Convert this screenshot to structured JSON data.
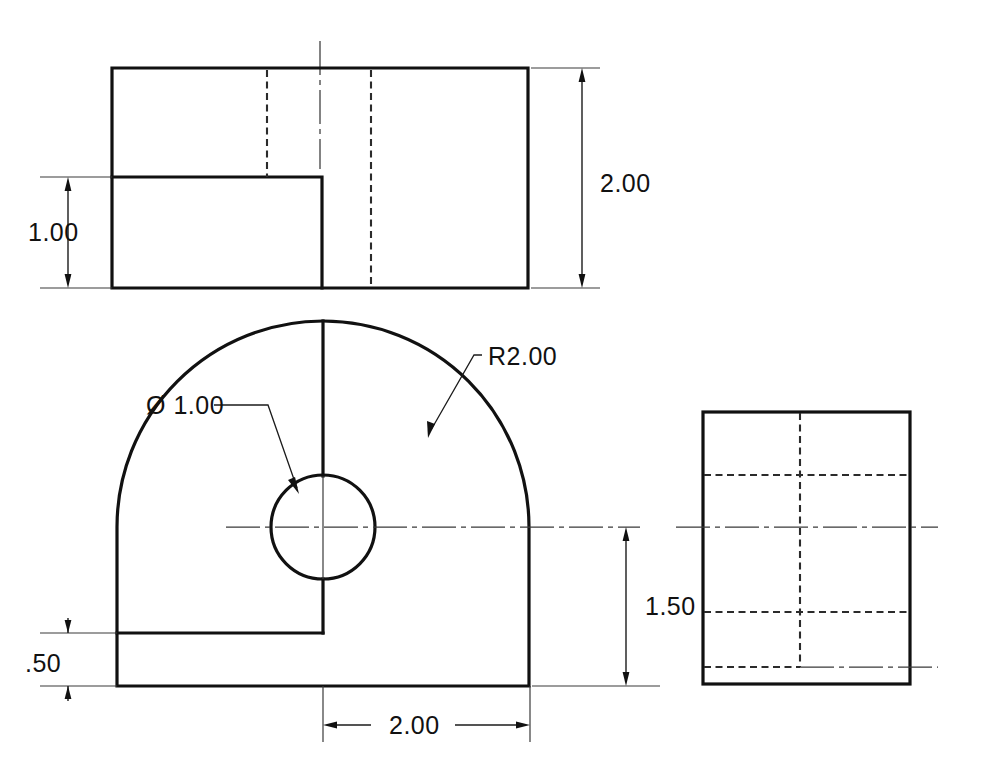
{
  "sheet": {
    "title": "Multiview Orthographic Engineering Drawing",
    "background_color": "#ffffff",
    "line_color": "#111111",
    "width": 990,
    "height": 778
  },
  "views": {
    "top": {
      "name": "Top View",
      "outline": {
        "x": 112,
        "y": 68,
        "width": 416,
        "height": 220
      },
      "step": {
        "edge_x": 322,
        "edge_y": 177
      },
      "hidden_lines_x": [
        267,
        371
      ],
      "centerline_x": 320
    },
    "front": {
      "name": "Front View",
      "base": {
        "left_x": 117,
        "right_x": 530,
        "bottom_y": 686
      },
      "step_y": 633,
      "arc_radius_px": 207,
      "arc_center": {
        "x": 323,
        "y": 527
      },
      "hole": {
        "cx": 323,
        "cy": 527,
        "r": 52
      }
    },
    "right": {
      "name": "Right Side View",
      "outline": {
        "x": 703,
        "y": 412,
        "width": 207,
        "height": 272
      },
      "hidden_vertical_x": 800,
      "hidden_horizontal_y": [
        475,
        612
      ],
      "centerline_y": 527,
      "lower_centerline_y": 667
    }
  },
  "dimensions": [
    {
      "id": "top-height",
      "label": "2.00",
      "value": 2.0,
      "kind": "linear-vertical",
      "view": "top",
      "text_x": 600,
      "text_y": 192
    },
    {
      "id": "top-step-height",
      "label": "1.00",
      "value": 1.0,
      "kind": "linear-vertical",
      "view": "top",
      "text_x": 28,
      "text_y": 241
    },
    {
      "id": "front-height",
      "label": "1.50",
      "value": 1.5,
      "kind": "linear-vertical",
      "view": "front",
      "text_x": 645,
      "text_y": 615
    },
    {
      "id": "front-base-height",
      "label": ".50",
      "value": 0.5,
      "kind": "linear-vertical",
      "view": "front",
      "text_x": 25,
      "text_y": 672
    },
    {
      "id": "front-width",
      "label": "2.00",
      "value": 2.0,
      "kind": "linear-horizontal",
      "view": "front",
      "text_x": 389,
      "text_y": 734
    },
    {
      "id": "hole-diameter",
      "label": "Ø 1.00",
      "value": 1.0,
      "kind": "diameter-leader",
      "view": "front",
      "text_x": 146,
      "text_y": 414
    },
    {
      "id": "arc-radius",
      "label": "R2.00",
      "value": 2.0,
      "kind": "radius-leader",
      "view": "front",
      "text_x": 488,
      "text_y": 365
    }
  ]
}
